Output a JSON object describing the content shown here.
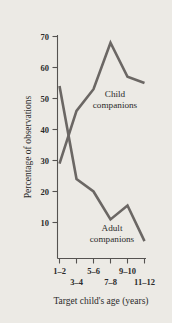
{
  "chart_data": {
    "type": "line",
    "title": "",
    "xlabel": "Target child's age (years)",
    "ylabel": "Percentage of observations",
    "categories": [
      "1–2",
      "3–4",
      "5–6",
      "7–8",
      "9–10",
      "11–12"
    ],
    "yticks": [
      10,
      20,
      30,
      40,
      50,
      60,
      70
    ],
    "ylim": [
      0,
      72
    ],
    "grid": false,
    "legend_position": "inline-annotations",
    "series": [
      {
        "name": "Child companions",
        "values": [
          29,
          46,
          53,
          68,
          57,
          55
        ],
        "color": "#6b6764",
        "annotation": {
          "line1": "Child",
          "line2": "companions"
        }
      },
      {
        "name": "Adult companions",
        "values": [
          54,
          24,
          20,
          11,
          15.5,
          4
        ],
        "color": "#6b6764",
        "annotation": {
          "line1": "Adult",
          "line2": "companions"
        }
      }
    ]
  },
  "axes": {
    "y_tick_labels": [
      "70",
      "60",
      "50",
      "40",
      "30",
      "20",
      "10"
    ],
    "x_tick_labels_top_row": [
      "1–2",
      "5–6",
      "9–10"
    ],
    "x_tick_labels_bottom_row": [
      "3–4",
      "7–8",
      "11–12"
    ],
    "x_axis_title": "Target child's age (years)",
    "y_axis_title": "Percentage of observations"
  },
  "annotations": {
    "child_line1": "Child",
    "child_line2": "companions",
    "adult_line1": "Adult",
    "adult_line2": "companions"
  },
  "colors": {
    "background": "#eceae5",
    "line": "#6b6764",
    "axis": "#555250",
    "text": "#2b2b2b"
  }
}
